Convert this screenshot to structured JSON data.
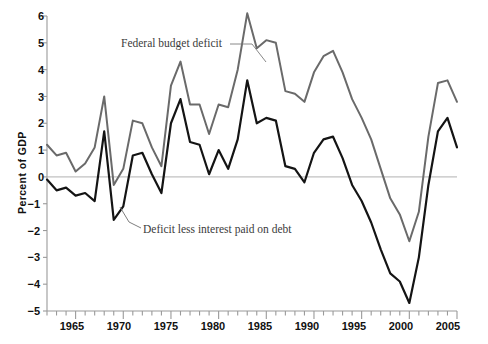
{
  "chart_data": {
    "type": "line",
    "title": "",
    "xlabel": "",
    "ylabel": "Percent of GDP",
    "xlim": [
      1962,
      2005
    ],
    "ylim": [
      -5,
      6
    ],
    "grid": false,
    "legend_position": "inline-annotations",
    "zero_line": 0,
    "y_ticks": [
      6,
      5,
      4,
      3,
      2,
      1,
      0,
      -1,
      -2,
      -3,
      -4,
      -5
    ],
    "y_tick_labels": [
      "6",
      "5",
      "4",
      "3",
      "2",
      "1",
      "0",
      "−1",
      "−2",
      "−3",
      "−4",
      "−5"
    ],
    "x_ticks": [
      1965,
      1970,
      1975,
      1980,
      1985,
      1990,
      1995,
      2000,
      2005
    ],
    "x_tick_labels": [
      "1965",
      "1970",
      "1975",
      "1980",
      "1985",
      "1990",
      "1995",
      "2000",
      "2005"
    ],
    "x_minor_tick_step": 1,
    "x": [
      1962,
      1963,
      1964,
      1965,
      1966,
      1967,
      1968,
      1969,
      1970,
      1971,
      1972,
      1973,
      1974,
      1975,
      1976,
      1977,
      1978,
      1979,
      1980,
      1981,
      1982,
      1983,
      1984,
      1985,
      1986,
      1987,
      1988,
      1989,
      1990,
      1991,
      1992,
      1993,
      1994,
      1995,
      1996,
      1997,
      1998,
      1999,
      2000,
      2001,
      2002,
      2003,
      2004,
      2005
    ],
    "series": [
      {
        "name": "Federal budget deficit",
        "color": "#6a6a6a",
        "annotation": "Federal budget deficit",
        "values": [
          1.2,
          0.8,
          0.9,
          0.2,
          0.5,
          1.1,
          3.0,
          -0.3,
          0.3,
          2.1,
          2.0,
          1.1,
          0.4,
          3.4,
          4.3,
          2.7,
          2.7,
          1.6,
          2.7,
          2.6,
          4.0,
          6.1,
          4.8,
          5.1,
          5.0,
          3.2,
          3.1,
          2.8,
          3.9,
          4.5,
          4.7,
          3.9,
          2.9,
          2.2,
          1.4,
          0.3,
          -0.8,
          -1.4,
          -2.4,
          -1.3,
          1.5,
          3.5,
          3.6,
          2.8
        ]
      },
      {
        "name": "Deficit less interest paid on debt",
        "color": "#141414",
        "annotation": "Deficit less interest paid on debt",
        "values": [
          -0.1,
          -0.5,
          -0.4,
          -0.7,
          -0.6,
          -0.9,
          1.7,
          -1.6,
          -1.1,
          0.8,
          0.9,
          0.1,
          -0.6,
          2.0,
          2.9,
          1.3,
          1.2,
          0.1,
          1.0,
          0.3,
          1.4,
          3.6,
          2.0,
          2.2,
          2.1,
          0.4,
          0.3,
          -0.2,
          0.9,
          1.4,
          1.5,
          0.7,
          -0.3,
          -0.9,
          -1.7,
          -2.7,
          -3.6,
          -3.9,
          -4.7,
          -3.0,
          -0.3,
          1.7,
          2.2,
          1.1
        ]
      }
    ]
  },
  "axes": {
    "y_axis_title": "Percent of GDP"
  }
}
